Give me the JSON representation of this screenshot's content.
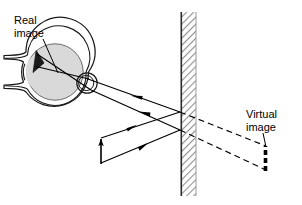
{
  "figure": {
    "width": 302,
    "height": 205,
    "background": "#ffffff"
  },
  "labels": {
    "real_image": "Real\nimage",
    "virtual_image": "Virtual\nimage"
  },
  "colors": {
    "ink": "#000000",
    "eye_fill": "#d9d9d9",
    "eye_outline": "#1a1a1a",
    "mirror_hatch": "#8a8a8a",
    "mirror_surface": "#303030",
    "mirror_body": "#ffffff",
    "ray_solid": "#000000",
    "ray_dashed": "#000000"
  },
  "geometry": {
    "eye": {
      "center_x": 55,
      "center_y": 72,
      "radius": 33,
      "cornea_x": 87,
      "cornea_y": 83,
      "cornea_r": 10
    },
    "mirror": {
      "surface_x": 180,
      "back_x": 196,
      "top_y": 12,
      "bottom_y": 196
    },
    "object_arrow": {
      "x": 101,
      "base_y": 163,
      "tip_y": 137
    },
    "virtual_arrow": {
      "x": 265,
      "base_y": 170,
      "tip_y": 146
    },
    "real_image_arrow": {
      "x": 37,
      "base_y": 51,
      "tip_y": 72
    },
    "rays": [
      {
        "name": "ray-upper-incident",
        "from": [
          101,
          137
        ],
        "to": [
          180,
          112
        ]
      },
      {
        "name": "ray-lower-incident",
        "from": [
          101,
          163
        ],
        "to": [
          180,
          130
        ]
      },
      {
        "name": "ray-upper-reflected",
        "from": [
          180,
          112
        ],
        "to": [
          88,
          79
        ]
      },
      {
        "name": "ray-lower-reflected",
        "from": [
          180,
          130
        ],
        "to": [
          90,
          88
        ]
      },
      {
        "name": "ray-virtual-upper",
        "from": [
          180,
          112
        ],
        "to": [
          265,
          146
        ]
      },
      {
        "name": "ray-virtual-lower",
        "from": [
          180,
          130
        ],
        "to": [
          265,
          170
        ]
      }
    ]
  },
  "annotations": {
    "real_image_leader": {
      "from": [
        42,
        40
      ],
      "to": [
        57,
        72
      ]
    },
    "virtual_image_leader": {
      "from": [
        262,
        134
      ],
      "to": [
        266,
        146
      ]
    }
  }
}
